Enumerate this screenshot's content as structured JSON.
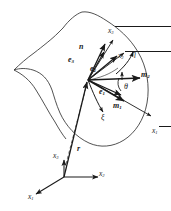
{
  "figure": {
    "type": "differential-geometry-surface-diagram",
    "stroke_color": "#1a1a1a",
    "background": "#ffffff"
  },
  "surface": {
    "name": "curved-shell-surface",
    "fill": "#ffffff",
    "stroke": "#333333"
  },
  "point": {
    "origin_label": "",
    "frame_origin_x": 88,
    "frame_origin_y": 80
  },
  "vectors": [
    {
      "key": "n",
      "label": "n",
      "bar": false,
      "sub": "",
      "bold": true,
      "lx": 82,
      "ly": 45,
      "tipx": 104,
      "tipy": 48
    },
    {
      "key": "e3",
      "label": "e",
      "bar": false,
      "sub": "3",
      "bold": true,
      "lx": 73,
      "ly": 59,
      "tipx": 107,
      "tipy": 55
    },
    {
      "key": "e2",
      "label": "e",
      "bar": false,
      "sub": "2",
      "bold": true,
      "lx": 91,
      "ly": 68,
      "tipx": 118,
      "tipy": 58
    },
    {
      "key": "e1",
      "label": "e",
      "bar": false,
      "sub": "1",
      "bold": true,
      "lx": 101,
      "ly": 91,
      "tipx": 122,
      "tipy": 96
    },
    {
      "key": "m1",
      "label": "m",
      "bar": false,
      "sub": "1",
      "bold": true,
      "lx": 116,
      "ly": 106,
      "tipx": 126,
      "tipy": 99
    },
    {
      "key": "m2",
      "label": "m",
      "bar": false,
      "sub": "2",
      "bold": true,
      "lx": 144,
      "ly": 75,
      "tipx": 141,
      "tipy": 79
    },
    {
      "key": "xbar3",
      "label": "x",
      "bar": true,
      "sub": "3",
      "bold": false,
      "lx": 110,
      "ly": 32,
      "tipx": 112,
      "tipy": 42
    },
    {
      "key": "xbar2",
      "label": "x",
      "bar": true,
      "sub": "2",
      "bold": false,
      "lx": 120,
      "ly": 47,
      "tipx": 124,
      "tipy": 54
    },
    {
      "key": "xbar1",
      "label": "x",
      "bar": true,
      "sub": "1",
      "bold": false,
      "lx": 154,
      "ly": 113,
      "tipx": 152,
      "tipy": 115
    }
  ],
  "curvilinear": [
    {
      "key": "xi",
      "label": "ξ",
      "lx": 103,
      "ly": 118
    },
    {
      "key": "eta",
      "label": "η",
      "lx": 134,
      "ly": 54
    }
  ],
  "angle": {
    "key": "theta",
    "label": "θ",
    "lx": 126,
    "ly": 87
  },
  "position_vector": {
    "key": "r",
    "label": "r",
    "lx": 79,
    "ly": 148
  },
  "global_frame": {
    "origin_x": 64,
    "origin_y": 177,
    "axes": [
      {
        "key": "x3",
        "label": "x",
        "sub": "3",
        "lx": 55,
        "ly": 155
      },
      {
        "key": "x2",
        "label": "x",
        "sub": "2",
        "lx": 99,
        "ly": 172
      },
      {
        "key": "x1",
        "label": "x",
        "sub": "1",
        "lx": 30,
        "ly": 195
      }
    ]
  }
}
